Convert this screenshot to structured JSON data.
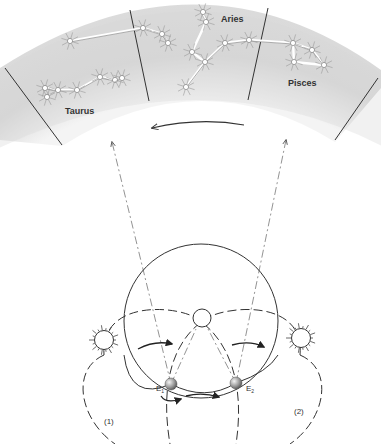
{
  "figure": {
    "constellations": [
      {
        "name": "Taurus"
      },
      {
        "name": "Aries"
      },
      {
        "name": "Pisces"
      }
    ],
    "earth_labels": {
      "e1": "E",
      "e1_sub": "1",
      "e2": "E",
      "e2_sub": "2"
    },
    "orbit_labels": {
      "left": "(1)",
      "right": "(2)"
    },
    "colors": {
      "band": "#d9d9d9",
      "line": "#333333",
      "star": "#ffffff"
    }
  }
}
